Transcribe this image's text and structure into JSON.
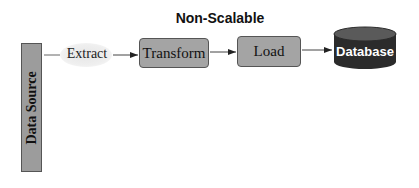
{
  "diagram": {
    "title": "Non-Scalable",
    "nodes": {
      "source": {
        "label": "Data Source",
        "shape": "vertical-bar",
        "color": "#9c9c9c"
      },
      "extract": {
        "label": "Extract",
        "shape": "ellipse-label",
        "color": "#ececec"
      },
      "transform": {
        "label": "Transform",
        "shape": "rounded-rect",
        "color": "#a4a4a4"
      },
      "load": {
        "label": "Load",
        "shape": "rounded-rect",
        "color": "#a4a4a4"
      },
      "database": {
        "label": "Database",
        "shape": "cylinder",
        "color": "#2b2b2b"
      }
    },
    "edges": [
      {
        "from": "Data Source",
        "to": "Transform",
        "label": "Extract"
      },
      {
        "from": "Transform",
        "to": "Load",
        "label": ""
      },
      {
        "from": "Load",
        "to": "Database",
        "label": ""
      }
    ]
  }
}
